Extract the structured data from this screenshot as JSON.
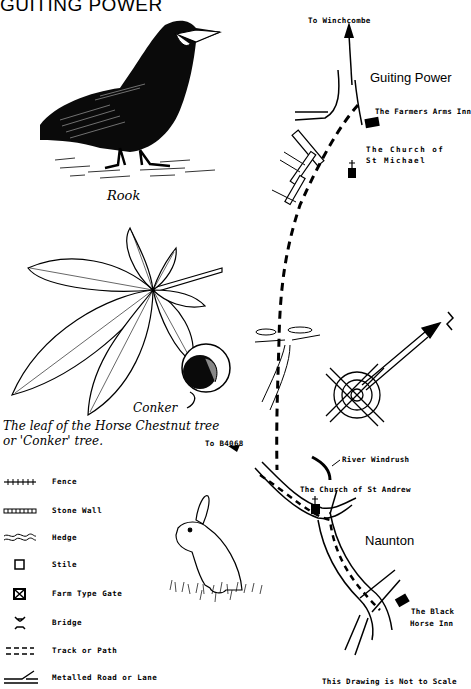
{
  "title": "GUITING POWER",
  "illustrations": {
    "rook_caption": "Rook",
    "leaf_caption_line1": "The leaf of the Horse Chestnut tree",
    "leaf_caption_line2": "or 'Conker' tree.",
    "conker_label": "Conker"
  },
  "map": {
    "labels": {
      "to_winchcombe": "To Winchcombe",
      "guiting_power": "Guiting Power",
      "farmers_arms": "The Farmers Arms Inn",
      "church_st_michael_1": "The Church of",
      "church_st_michael_2": "St Michael",
      "to_b4068": "To B4068",
      "river_windrush": "River Windrush",
      "church_st_andrew": "The Church of St Andrew",
      "naunton": "Naunton",
      "black_horse_1": "The Black",
      "black_horse_2": "Horse Inn"
    },
    "compass_north_label": "N",
    "scale_note": "This Drawing is Not to Scale"
  },
  "legend": {
    "items": [
      {
        "symbol": "fence-icon",
        "label": "Fence"
      },
      {
        "symbol": "stone-wall-icon",
        "label": "Stone Wall"
      },
      {
        "symbol": "hedge-icon",
        "label": "Hedge"
      },
      {
        "symbol": "stile-icon",
        "label": "Stile"
      },
      {
        "symbol": "farm-gate-icon",
        "label": "Farm Type Gate"
      },
      {
        "symbol": "bridge-icon",
        "label": "Bridge"
      },
      {
        "symbol": "track-path-icon",
        "label": "Track or Path"
      },
      {
        "symbol": "metalled-road-icon",
        "label": "Metalled Road or Lane"
      }
    ]
  }
}
